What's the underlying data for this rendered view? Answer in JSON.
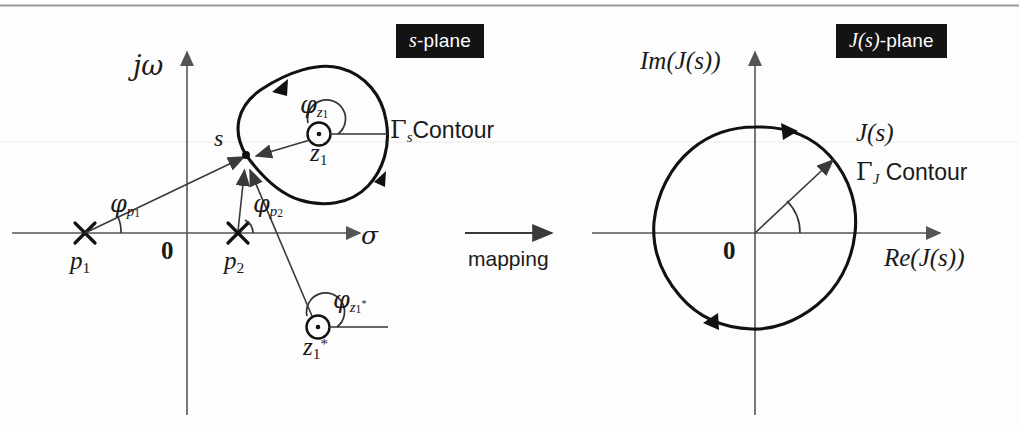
{
  "figure": {
    "background_color": "#fdfdfd",
    "ink_color": "#1a1a1a",
    "axis_color": "#555555"
  },
  "left_panel": {
    "badge": {
      "prefix": "s",
      "suffix": "-plane"
    },
    "axis_vertical_label": "jω",
    "axis_horizontal_label": "σ",
    "origin_label": "0",
    "point_s_label": "s",
    "contour_label": {
      "gamma": "Γ",
      "sub": "s",
      "word": "Contour"
    },
    "poles": [
      {
        "name": "p",
        "sub": "1",
        "x": 85,
        "y": 233
      },
      {
        "name": "p",
        "sub": "2",
        "x": 238,
        "y": 233
      }
    ],
    "zeros": [
      {
        "name": "z",
        "sub": "1",
        "star": false,
        "x": 319,
        "y": 134
      },
      {
        "name": "z",
        "sub": "1",
        "star": true,
        "x": 318,
        "y": 327
      }
    ],
    "angles": [
      {
        "name": "φ",
        "sub": "p",
        "subsub": "1",
        "at_pole": "p1"
      },
      {
        "name": "φ",
        "sub": "p",
        "subsub": "2",
        "at_pole": "p2"
      },
      {
        "name": "φ",
        "sub": "z",
        "subsub": "1",
        "at_zero": "z1"
      },
      {
        "name": "φ",
        "sub": "z",
        "subsub": "1",
        "star": true,
        "at_zero": "z1star"
      }
    ]
  },
  "mapping": {
    "label": "mapping",
    "arrow": "→"
  },
  "right_panel": {
    "badge": {
      "prefix": "J(s)",
      "suffix": "-plane"
    },
    "axis_vertical_label": "Im(J(s))",
    "axis_horizontal_label": "Re(J(s))",
    "origin_label": "0",
    "vector_label": "J(s)",
    "contour_label": {
      "gamma": "Γ",
      "sub": "J",
      "word": "Contour"
    }
  }
}
